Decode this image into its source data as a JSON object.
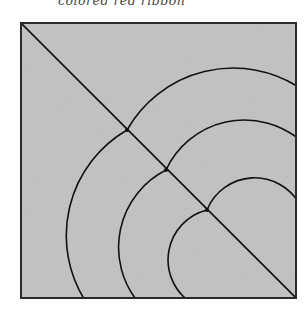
{
  "caption": "colored red ribbon",
  "figure": {
    "colors": {
      "fill": "#c9c9c9",
      "border": "#2a2a2a",
      "line": "#111111"
    }
  }
}
